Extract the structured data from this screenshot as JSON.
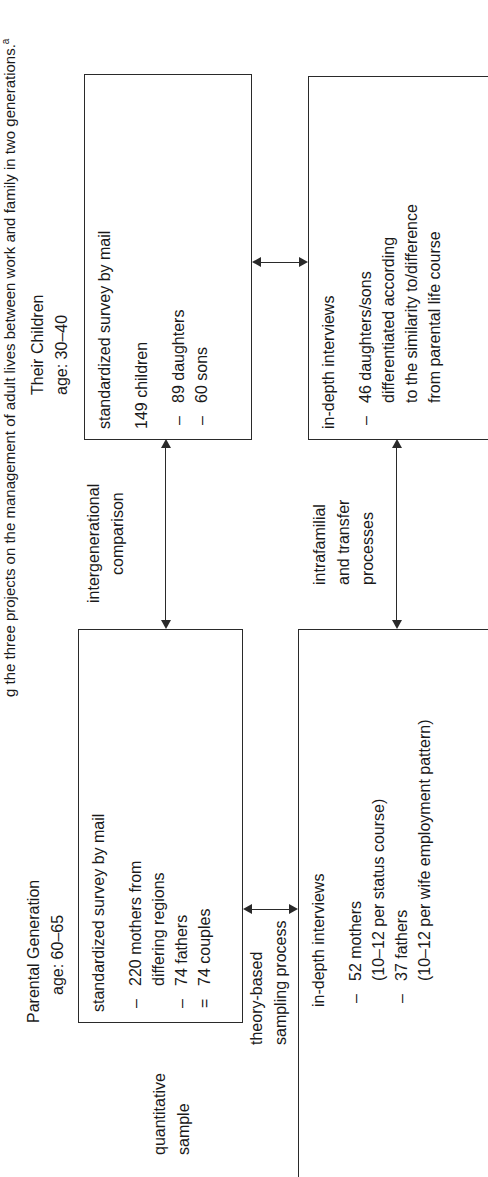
{
  "caption": {
    "text": "g the three projects on the management of adult lives between work and family in two generations.",
    "footnote_marker": "a"
  },
  "columns": {
    "parental": {
      "title": "Parental Generation",
      "age": "age: 60–65"
    },
    "children": {
      "title": "Their Children",
      "age": "age: 30–40"
    }
  },
  "row_labels": {
    "quantitative": [
      "quantitative",
      "sample"
    ],
    "sampling": [
      "theory-based",
      "sampling process"
    ],
    "qualitative": [
      "qualitative",
      "sample"
    ]
  },
  "connectors": {
    "intergenerational": [
      "intergenerational",
      "comparison"
    ],
    "intrafamilial": [
      "intrafamilial",
      "and transfer",
      "processes"
    ]
  },
  "boxes": {
    "parental_survey": {
      "title": "standardized survey by mail",
      "items": [
        {
          "bullet": "–",
          "lines": [
            "220 mothers from",
            "differing regions"
          ]
        },
        {
          "bullet": "–",
          "lines": [
            "74 fathers"
          ]
        },
        {
          "bullet": "=",
          "lines": [
            "74 couples"
          ]
        }
      ]
    },
    "children_survey": {
      "title": "standardized survey by mail",
      "count": "149 children",
      "items": [
        {
          "bullet": "–",
          "lines": [
            "89 daughters"
          ]
        },
        {
          "bullet": "–",
          "lines": [
            "60 sons"
          ]
        }
      ]
    },
    "parental_interviews": {
      "title": "in-depth interviews",
      "items": [
        {
          "bullet": "–",
          "lines": [
            "52 mothers",
            "(10–12 per status course)"
          ]
        },
        {
          "bullet": "–",
          "lines": [
            "37 fathers",
            "(10–12 per wife employment pattern)"
          ]
        }
      ]
    },
    "children_interviews": {
      "title": "in-depth interviews",
      "items": [
        {
          "bullet": "–",
          "lines": [
            "46 daughters/sons",
            "differentiated according",
            "to the similarity to/difference",
            "from parental life course"
          ]
        }
      ]
    }
  }
}
